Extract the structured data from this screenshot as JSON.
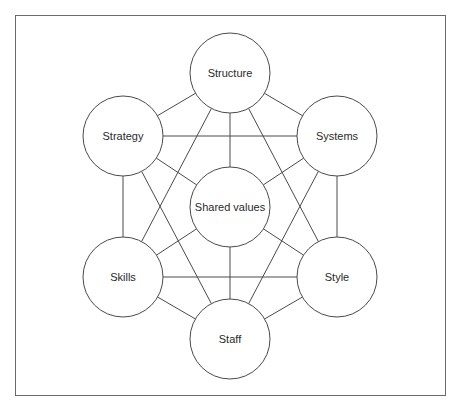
{
  "diagram": {
    "title": "",
    "colors": {
      "line": "#4a4a4a",
      "frame": "#6a6a6a",
      "text": "#2a2a2a",
      "fill": "#ffffff"
    },
    "nodes": [
      {
        "id": "structure",
        "label": "Structure",
        "cx": 230,
        "cy": 73
      },
      {
        "id": "strategy",
        "label": "Strategy",
        "cx": 123,
        "cy": 136
      },
      {
        "id": "systems",
        "label": "Systems",
        "cx": 337,
        "cy": 136
      },
      {
        "id": "shared-values",
        "label": "Shared values",
        "cx": 230,
        "cy": 207
      },
      {
        "id": "skills",
        "label": "Skills",
        "cx": 123,
        "cy": 277
      },
      {
        "id": "style",
        "label": "Style",
        "cx": 337,
        "cy": 277
      },
      {
        "id": "staff",
        "label": "Staff",
        "cx": 230,
        "cy": 339
      }
    ],
    "radius": 40,
    "edges": [
      [
        "structure",
        "strategy"
      ],
      [
        "structure",
        "systems"
      ],
      [
        "structure",
        "shared-values"
      ],
      [
        "structure",
        "skills"
      ],
      [
        "structure",
        "style"
      ],
      [
        "strategy",
        "systems"
      ],
      [
        "strategy",
        "skills"
      ],
      [
        "strategy",
        "shared-values"
      ],
      [
        "strategy",
        "staff"
      ],
      [
        "systems",
        "style"
      ],
      [
        "systems",
        "shared-values"
      ],
      [
        "systems",
        "staff"
      ],
      [
        "skills",
        "style"
      ],
      [
        "skills",
        "shared-values"
      ],
      [
        "skills",
        "staff"
      ],
      [
        "style",
        "shared-values"
      ],
      [
        "style",
        "staff"
      ],
      [
        "shared-values",
        "staff"
      ]
    ]
  }
}
